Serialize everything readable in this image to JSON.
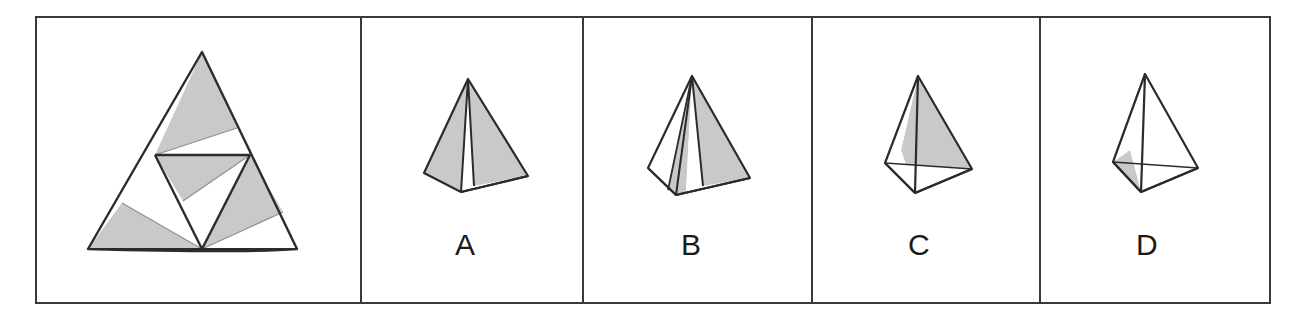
{
  "figure": {
    "type": "spatial-reasoning-multiple-choice",
    "background_color": "#ffffff",
    "stroke_color": "#2b2b2b",
    "shade_color": "#c9c9c9",
    "frame": {
      "x": 35,
      "y": 16,
      "width": 1235,
      "height": 287,
      "stroke_width": 2
    },
    "dividers_x": [
      361,
      583,
      812,
      1040
    ]
  },
  "panels": [
    {
      "id": "net-panel",
      "name": "unfolded-net",
      "label": "",
      "description": "Unfolded net of a tetrahedron: large outer triangle subdivided into four smaller triangles, each partly shaded grey."
    },
    {
      "id": "option-a",
      "name": "option-a",
      "label": "A",
      "label_x": 462,
      "label_y": 232
    },
    {
      "id": "option-b",
      "name": "option-b",
      "label": "B",
      "label_x": 685,
      "label_y": 232
    },
    {
      "id": "option-c",
      "name": "option-c",
      "label": "C",
      "label_x": 913,
      "label_y": 232
    },
    {
      "id": "option-d",
      "name": "option-d",
      "label": "D",
      "label_x": 1140,
      "label_y": 232
    }
  ],
  "net_geometry": {
    "outer_triangle": [
      [
        202,
        52
      ],
      [
        88,
        249
      ],
      [
        297,
        249
      ]
    ],
    "midpoints": {
      "left": [
        155,
        155
      ],
      "right": [
        250,
        155
      ],
      "bottom": [
        202,
        249
      ]
    },
    "bottom_bow_control": [
      [
        202,
        249
      ],
      [
        245,
        252
      ],
      [
        297,
        249
      ]
    ],
    "shaded_regions": [
      {
        "name": "top-face-shade",
        "points": [
          [
            202,
            52
          ],
          [
            155,
            155
          ],
          [
            237,
            128
          ]
        ]
      },
      {
        "name": "center-face-shade",
        "points": [
          [
            155,
            155
          ],
          [
            250,
            155
          ],
          [
            183,
            201
          ]
        ]
      },
      {
        "name": "left-face-shade",
        "points": [
          [
            122,
            203
          ],
          [
            88,
            249
          ],
          [
            202,
            249
          ]
        ]
      },
      {
        "name": "right-face-shade",
        "points": [
          [
            250,
            155
          ],
          [
            202,
            249
          ],
          [
            283,
            212
          ]
        ]
      }
    ],
    "inner_lines": [
      [
        [
          155,
          155
        ],
        [
          250,
          155
        ]
      ],
      [
        [
          155,
          155
        ],
        [
          202,
          249
        ]
      ],
      [
        [
          250,
          155
        ],
        [
          202,
          249
        ]
      ]
    ]
  },
  "option_geometry": {
    "a": {
      "apex": [
        468,
        79
      ],
      "base_left": [
        424,
        173
      ],
      "base_front": [
        461,
        192
      ],
      "base_right": [
        528,
        176
      ],
      "shaded": [
        "left-face",
        "right-face"
      ]
    },
    "b": {
      "apex": [
        692,
        76
      ],
      "base_left": [
        644,
        174
      ],
      "base_front": [
        676,
        195
      ],
      "base_right": [
        740,
        178
      ],
      "shaded": [
        "center-face",
        "right-face"
      ]
    },
    "c": {
      "apex": [
        918,
        76
      ],
      "base_left": [
        885,
        163
      ],
      "base_front": [
        915,
        193
      ],
      "base_right": [
        972,
        169
      ],
      "shaded": [
        "back-face"
      ]
    },
    "d": {
      "apex": [
        1145,
        74
      ],
      "base_left": [
        1113,
        162
      ],
      "base_front": [
        1141,
        192
      ],
      "base_right": [
        1198,
        168
      ],
      "shaded": [
        "left-face",
        "bottom-face"
      ]
    }
  }
}
